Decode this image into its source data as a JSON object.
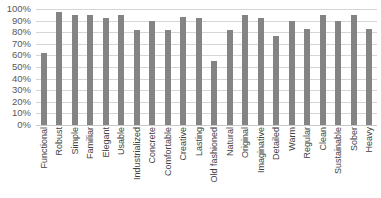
{
  "chart_data": {
    "type": "bar",
    "title": "",
    "xlabel": "",
    "ylabel": "",
    "ylim": [
      0,
      100
    ],
    "grid": true,
    "legend": "none",
    "bar_color": "#848484",
    "gridline_color": "#d6d6d6",
    "categories": [
      "Functional",
      "Robust",
      "Simple",
      "Familiar",
      "Elegant",
      "Usable",
      "Industrialized",
      "Concrete",
      "Comfortable",
      "Creative",
      "Lasting",
      "Old fashioned",
      "Natural",
      "Original",
      "Imaginative",
      "Detailed",
      "Warm",
      "Regular",
      "Clean",
      "Sustainable",
      "Sober",
      "Heavy"
    ],
    "values": [
      62,
      97,
      95,
      95,
      92,
      95,
      82,
      90,
      82,
      93,
      92,
      55,
      82,
      95,
      92,
      77,
      90,
      83,
      95,
      90,
      95,
      83
    ],
    "ytick_labels": [
      "100%",
      "90%",
      "80%",
      "70%",
      "60%",
      "50%",
      "40%",
      "30%",
      "20%",
      "10%",
      "0%"
    ],
    "ytick_values": [
      100,
      90,
      80,
      70,
      60,
      50,
      40,
      30,
      20,
      10,
      0
    ]
  }
}
